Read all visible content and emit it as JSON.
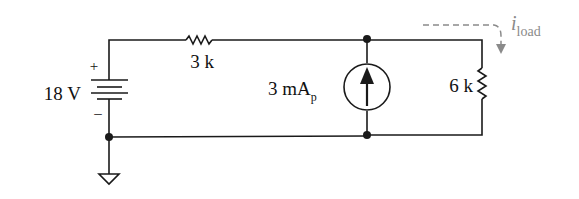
{
  "diagram": {
    "type": "circuit-schematic",
    "components": {
      "voltage_source": {
        "label": "18 V",
        "plus": "+",
        "minus": "–"
      },
      "series_resistor": {
        "label": "3 k"
      },
      "current_source": {
        "label_main": "3 mA",
        "label_sub": "p",
        "direction": "up"
      },
      "load_resistor": {
        "label": "6 k"
      },
      "ground": {
        "symbol": "ground"
      }
    },
    "annotations": {
      "load_current": {
        "symbol": "i",
        "subscript": "load",
        "color": "#8a8a8a"
      }
    },
    "colors": {
      "wire": "#1a1a1a",
      "annotation": "#8a8a8a"
    }
  }
}
